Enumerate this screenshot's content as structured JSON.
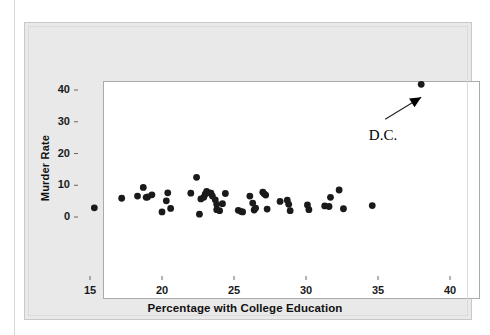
{
  "chart_data": {
    "type": "scatter",
    "title": "",
    "xlabel": "Percentage with College Education",
    "ylabel": "Murder Rate",
    "xlim": [
      13.8,
      40.8
    ],
    "ylim": [
      -1.5,
      43.5
    ],
    "xticks": [
      15,
      20,
      25,
      30,
      35,
      40
    ],
    "yticks": [
      0,
      10,
      20,
      30,
      40
    ],
    "xtick_labels": [
      "15",
      "20",
      "25",
      "30",
      "35",
      "40"
    ],
    "ytick_labels": [
      "0",
      "10",
      "20",
      "30",
      "40"
    ],
    "grid": false,
    "legend": null,
    "marker": {
      "shape": "circle",
      "color": "#1a1a1a",
      "size": 4.2
    },
    "annotations": [
      {
        "text": "D.C.",
        "text_x": 35.0,
        "text_y": 25.8,
        "arrow_from_x": 35.5,
        "arrow_from_y": 30.8,
        "arrow_to_x": 38.0,
        "arrow_to_y": 41.2
      }
    ],
    "points": [
      {
        "x": 15.3,
        "y": 2.9
      },
      {
        "x": 17.2,
        "y": 5.9
      },
      {
        "x": 18.3,
        "y": 6.6
      },
      {
        "x": 18.7,
        "y": 9.3
      },
      {
        "x": 18.9,
        "y": 6.2
      },
      {
        "x": 19.0,
        "y": 6.3
      },
      {
        "x": 19.3,
        "y": 7.0
      },
      {
        "x": 20.0,
        "y": 1.6
      },
      {
        "x": 20.3,
        "y": 5.1
      },
      {
        "x": 20.4,
        "y": 7.6
      },
      {
        "x": 20.6,
        "y": 2.7
      },
      {
        "x": 22.0,
        "y": 7.5
      },
      {
        "x": 22.4,
        "y": 12.5
      },
      {
        "x": 22.6,
        "y": 0.9
      },
      {
        "x": 22.7,
        "y": 5.7
      },
      {
        "x": 22.9,
        "y": 6.2
      },
      {
        "x": 23.0,
        "y": 7.2
      },
      {
        "x": 23.1,
        "y": 8.1
      },
      {
        "x": 23.3,
        "y": 7.6
      },
      {
        "x": 23.4,
        "y": 7.5
      },
      {
        "x": 23.5,
        "y": 6.6
      },
      {
        "x": 23.7,
        "y": 5.4
      },
      {
        "x": 23.8,
        "y": 4.0
      },
      {
        "x": 23.8,
        "y": 2.3
      },
      {
        "x": 24.0,
        "y": 2.0
      },
      {
        "x": 24.2,
        "y": 4.2
      },
      {
        "x": 24.4,
        "y": 7.4
      },
      {
        "x": 25.3,
        "y": 2.1
      },
      {
        "x": 25.5,
        "y": 1.7
      },
      {
        "x": 25.6,
        "y": 1.6
      },
      {
        "x": 26.1,
        "y": 6.6
      },
      {
        "x": 26.3,
        "y": 4.4
      },
      {
        "x": 26.4,
        "y": 2.2
      },
      {
        "x": 26.5,
        "y": 2.8
      },
      {
        "x": 27.0,
        "y": 7.8
      },
      {
        "x": 27.1,
        "y": 7.3
      },
      {
        "x": 27.2,
        "y": 6.9
      },
      {
        "x": 27.3,
        "y": 2.5
      },
      {
        "x": 28.2,
        "y": 4.9
      },
      {
        "x": 28.7,
        "y": 5.3
      },
      {
        "x": 28.8,
        "y": 4.0
      },
      {
        "x": 28.9,
        "y": 2.0
      },
      {
        "x": 30.1,
        "y": 3.8
      },
      {
        "x": 30.2,
        "y": 2.3
      },
      {
        "x": 31.3,
        "y": 3.5
      },
      {
        "x": 31.6,
        "y": 3.3
      },
      {
        "x": 31.7,
        "y": 6.2
      },
      {
        "x": 32.3,
        "y": 8.5
      },
      {
        "x": 32.6,
        "y": 2.6
      },
      {
        "x": 34.6,
        "y": 3.6
      },
      {
        "x": 38.0,
        "y": 41.8
      }
    ]
  }
}
